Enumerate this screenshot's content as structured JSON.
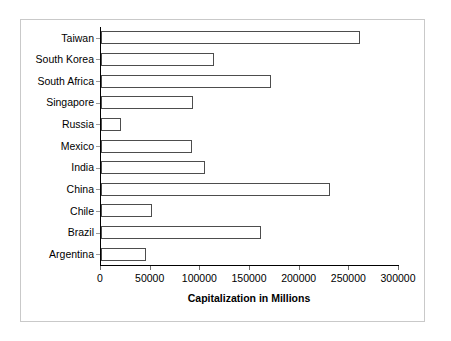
{
  "chart_data": {
    "type": "bar",
    "orientation": "horizontal",
    "title": "",
    "xlabel": "Capitalization in Millions",
    "ylabel": "",
    "categories": [
      "Taiwan",
      "South Korea",
      "South Africa",
      "Singapore",
      "Russia",
      "Mexico",
      "India",
      "China",
      "Chile",
      "Brazil",
      "Argentina"
    ],
    "values": [
      261000,
      114000,
      171000,
      93000,
      20000,
      92000,
      105000,
      231000,
      51000,
      161000,
      45000
    ],
    "xlim": [
      0,
      300000
    ],
    "xticks": [
      0,
      50000,
      100000,
      150000,
      200000,
      250000,
      300000
    ],
    "xtick_labels": [
      "0",
      "50000",
      "100000",
      "150000",
      "200000",
      "250000",
      "300000"
    ],
    "grid": false,
    "legend": false,
    "bar_fill_color": "#ffffff",
    "bar_border_color": "#4d4d4d",
    "axis_color": "#000000",
    "frame_border_color": "#c9c9c9",
    "background_color": "#ffffff"
  }
}
